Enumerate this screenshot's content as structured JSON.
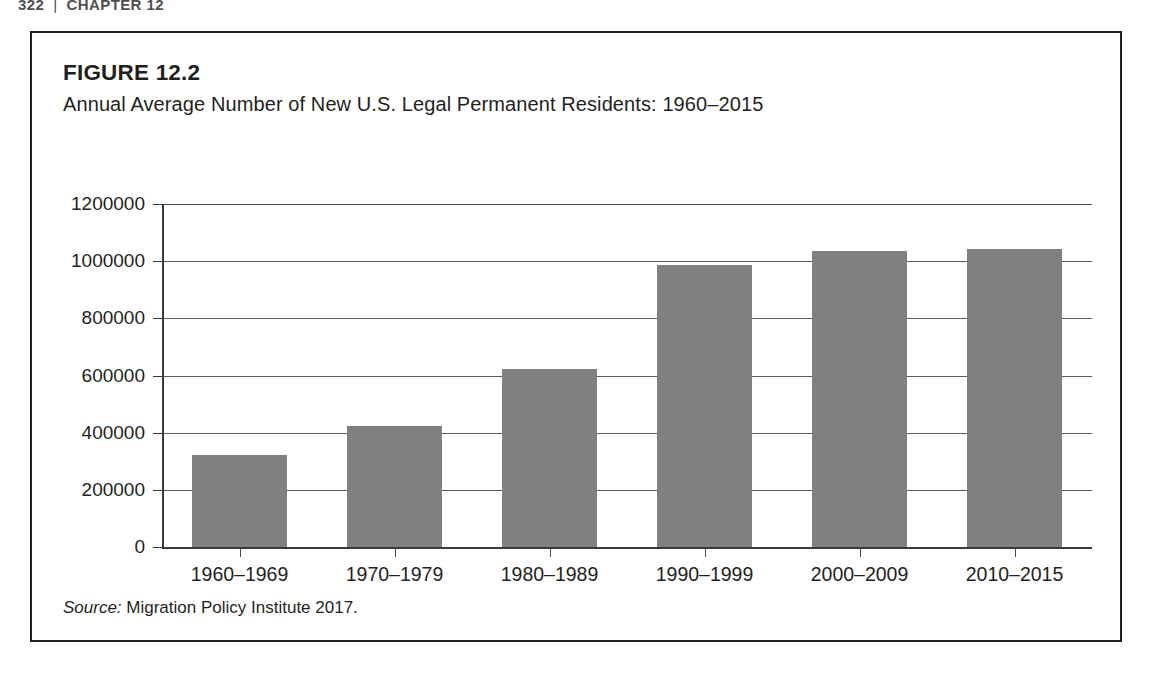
{
  "running_head": {
    "page_number": "322",
    "separator": "|",
    "chapter": "CHAPTER 12"
  },
  "figure": {
    "label": "FIGURE 12.2",
    "title": "Annual Average Number of New U.S. Legal Permanent Residents: 1960–2015",
    "source_word": "Source:",
    "source_text": " Migration Policy Institute 2017."
  },
  "colors": {
    "bar_fill": "#808080",
    "axis": "#3a3a3a",
    "gridline": "#5a5a5a",
    "border": "#231f20",
    "text": "#231f20"
  },
  "chart_data": {
    "type": "bar",
    "title": "Annual Average Number of New U.S. Legal Permanent Residents: 1960–2015",
    "xlabel": "",
    "ylabel": "",
    "categories": [
      "1960–1969",
      "1970–1979",
      "1980–1989",
      "1990–1999",
      "2000–2009",
      "2010–2015"
    ],
    "values": [
      321000,
      424000,
      624000,
      985000,
      1035000,
      1042000
    ],
    "ylim": [
      0,
      1200000
    ],
    "ytick_labels": [
      "1200000",
      "1000000",
      "800000",
      "600000",
      "400000",
      "200000",
      "0"
    ],
    "ytick_values": [
      1200000,
      1000000,
      800000,
      600000,
      400000,
      200000,
      0
    ],
    "grid": true,
    "legend": "none",
    "source": "Source: Migration Policy Institute 2017."
  }
}
